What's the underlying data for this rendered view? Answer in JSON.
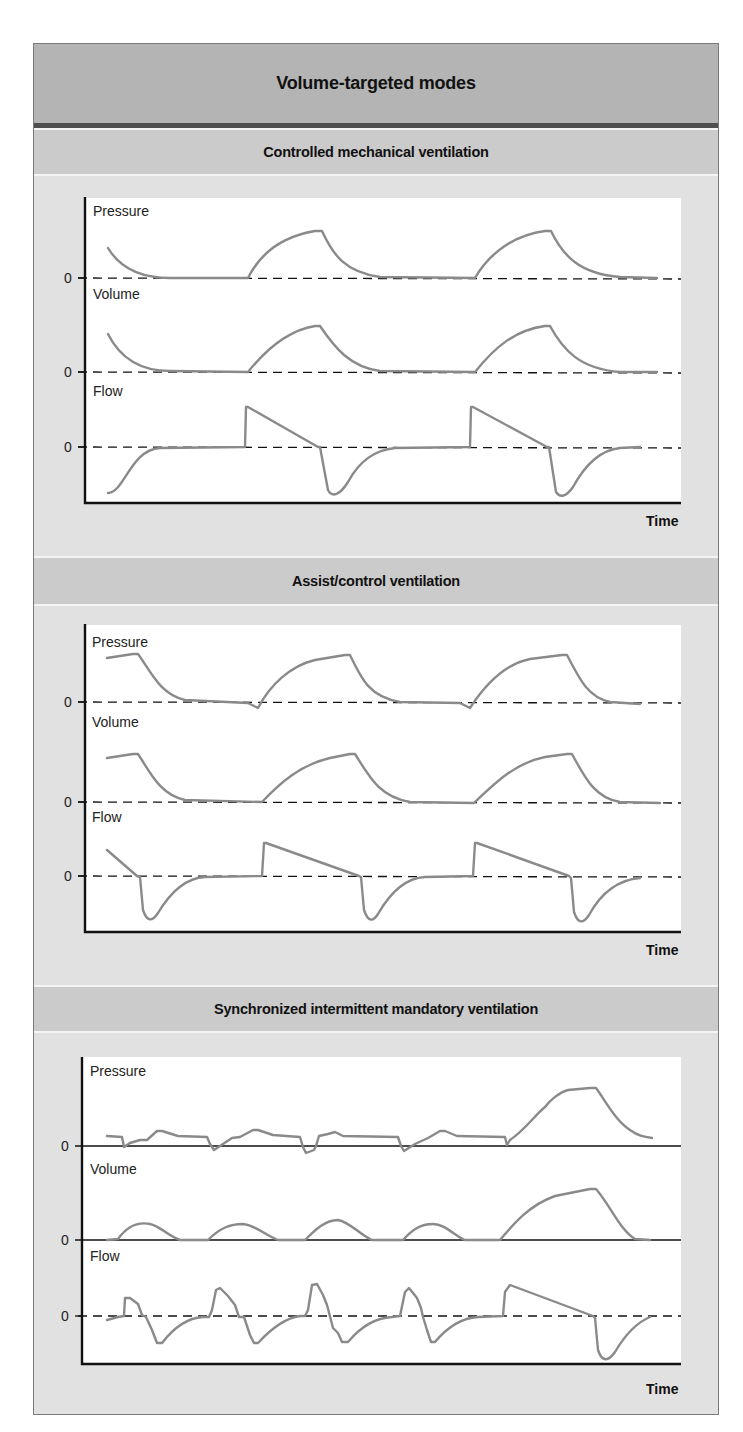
{
  "title": "Volume-targeted modes",
  "colors": {
    "frame_bg": "#e1e1e1",
    "title_band": "#b4b4b4",
    "section_header": "#cbcbcb",
    "trace": "#8a8a8a",
    "axis": "#111111"
  },
  "sections": [
    {
      "title": "Controlled mechanical ventilation",
      "x_axis_label": "Time",
      "traces": [
        {
          "label": "Pressure",
          "zero": "0",
          "baseline": "dashed"
        },
        {
          "label": "Volume",
          "zero": "0",
          "baseline": "dashed"
        },
        {
          "label": "Flow",
          "zero": "0",
          "baseline": "dashed"
        }
      ]
    },
    {
      "title": "Assist/control ventilation",
      "x_axis_label": "Time",
      "traces": [
        {
          "label": "Pressure",
          "zero": "0",
          "baseline": "dashed"
        },
        {
          "label": "Volume",
          "zero": "0",
          "baseline": "dashed"
        },
        {
          "label": "Flow",
          "zero": "0",
          "baseline": "dashed"
        }
      ]
    },
    {
      "title": "Synchronized intermittent mandatory ventilation",
      "x_axis_label": "Time",
      "traces": [
        {
          "label": "Pressure",
          "zero": "0",
          "baseline": "solid"
        },
        {
          "label": "Volume",
          "zero": "0",
          "baseline": "solid"
        },
        {
          "label": "Flow",
          "zero": "0",
          "baseline": "dashed"
        }
      ]
    }
  ]
}
